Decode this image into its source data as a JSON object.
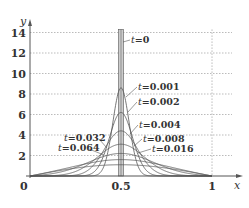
{
  "chart_data": {
    "type": "line",
    "title": "",
    "xlabel": "x",
    "ylabel": "y",
    "xlim": [
      0,
      1.1
    ],
    "ylim": [
      0,
      15
    ],
    "grid": {
      "horizontal": true,
      "vertical_at": [
        1
      ],
      "style": "dotted"
    },
    "x_ticks": [
      {
        "value": 0,
        "label": "0"
      },
      {
        "value": 0.5,
        "label": "0.5"
      },
      {
        "value": 1,
        "label": "1"
      }
    ],
    "y_ticks": [
      {
        "value": 2,
        "label": "2"
      },
      {
        "value": 4,
        "label": "4"
      },
      {
        "value": 6,
        "label": "6"
      },
      {
        "value": 8,
        "label": "8"
      },
      {
        "value": 10,
        "label": "10"
      },
      {
        "value": 12,
        "label": "12"
      },
      {
        "value": 14,
        "label": "14"
      }
    ],
    "initial_condition": {
      "label": "t=0",
      "description": "delta spike at x=0.5 (shaded vertical bar)"
    },
    "series": [
      {
        "name": "t=0.001",
        "t": 0.001,
        "peak": 8.6
      },
      {
        "name": "t=0.002",
        "t": 0.002,
        "peak": 6.2
      },
      {
        "name": "t=0.004",
        "t": 0.004,
        "peak": 4.4
      },
      {
        "name": "t=0.008",
        "t": 0.008,
        "peak": 3.1
      },
      {
        "name": "t=0.016",
        "t": 0.016,
        "peak": 2.2
      },
      {
        "name": "t=0.032",
        "t": 0.032,
        "peak": 1.6
      },
      {
        "name": "t=0.064",
        "t": 0.064,
        "peak": 1.1
      }
    ],
    "annotations": [
      {
        "text": "t=0",
        "t_part": "t",
        "value_part": "=0"
      },
      {
        "text": "t=0.001",
        "t_part": "t",
        "value_part": "=0.001"
      },
      {
        "text": "t=0.002",
        "t_part": "t",
        "value_part": "=0.002"
      },
      {
        "text": "t=0.004",
        "t_part": "t",
        "value_part": "=0.004"
      },
      {
        "text": "t=0.008",
        "t_part": "t",
        "value_part": "=0.008"
      },
      {
        "text": "t=0.016",
        "t_part": "t",
        "value_part": "=0.016"
      },
      {
        "text": "t=0.032",
        "t_part": "t",
        "value_part": "=0.032"
      },
      {
        "text": "t=0.064",
        "t_part": "t",
        "value_part": "=0.064"
      }
    ]
  },
  "colors": {
    "axis": "#555555",
    "grid": "#aaaaaa",
    "curve": "#555555",
    "spike_fill": "#cccccc",
    "text": "#333333"
  }
}
